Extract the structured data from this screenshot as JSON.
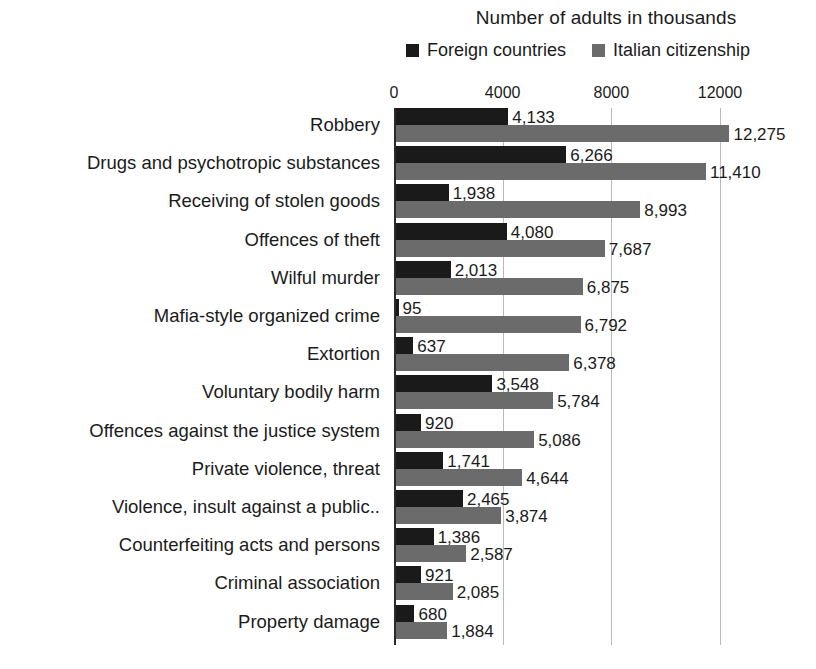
{
  "chart_data": {
    "type": "bar",
    "orientation": "horizontal",
    "title": "Number of adults in thousands",
    "xlabel": "",
    "ylabel": "",
    "xlim": [
      0,
      13000
    ],
    "xticks": [
      0,
      4000,
      8000,
      12000
    ],
    "xtick_labels": [
      "0",
      "4000",
      "8000",
      "12000"
    ],
    "grid": true,
    "legend_position": "top",
    "categories": [
      "Robbery",
      "Drugs and psychotropic substances",
      "Receiving of stolen goods",
      "Offences of theft",
      "Wilful murder",
      "Mafia-style organized crime",
      "Extortion",
      "Voluntary bodily harm",
      "Offences against the justice system",
      "Private violence, threat",
      "Violence, insult against a public..",
      "Counterfeiting acts and persons",
      "Criminal association",
      "Property damage"
    ],
    "series": [
      {
        "name": "Foreign countries",
        "color": "#1a1a1a",
        "values": [
          4133,
          6266,
          1938,
          4080,
          2013,
          95,
          637,
          3548,
          920,
          1741,
          2465,
          1386,
          921,
          680
        ],
        "value_labels": [
          "4,133",
          "6,266",
          "1,938",
          "4,080",
          "2,013",
          "95",
          "637",
          "3,548",
          "920",
          "1,741",
          "2,465",
          "1,386",
          "921",
          "680"
        ]
      },
      {
        "name": "Italian citizenship",
        "color": "#6b6b6b",
        "values": [
          12275,
          11410,
          8993,
          7687,
          6875,
          6792,
          6378,
          5784,
          5086,
          4644,
          3874,
          2587,
          2085,
          1884
        ],
        "value_labels": [
          "12,275",
          "11,410",
          "8,993",
          "7,687",
          "6,875",
          "6,792",
          "6,378",
          "5,784",
          "5,086",
          "4,644",
          "3,874",
          "2,587",
          "2,085",
          "1,884"
        ]
      }
    ]
  },
  "legend": {
    "entries": [
      {
        "label": "Foreign countries",
        "swatch": "dark"
      },
      {
        "label": "Italian citizenship",
        "swatch": "gray"
      }
    ]
  }
}
